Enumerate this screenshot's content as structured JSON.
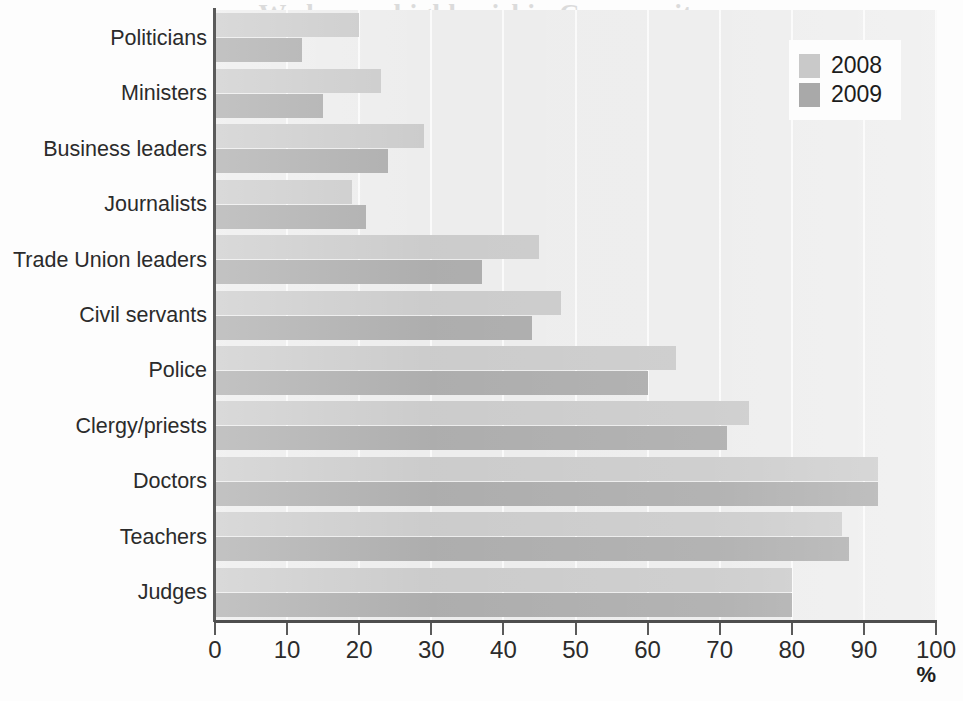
{
  "page": {
    "width": 963,
    "height": 701,
    "background": "#fdfdfd",
    "bleed_text": [
      "n. We have a highly riskin Community",
      "the selected and trusted p",
      "of trust in the, to main wo",
      "doctors and teachers, 2008 Only edi",
      "beyond had to know. For instance they con",
      "the equally collapsed",
      "ir organisation in the ways",
      "collate. They were"
    ]
  },
  "chart_data": {
    "type": "bar",
    "orientation": "horizontal",
    "title": "",
    "subtitle": "",
    "xlabel": "%",
    "ylabel": "",
    "xlim": [
      0,
      100
    ],
    "xticks": [
      0,
      10,
      20,
      30,
      40,
      50,
      60,
      70,
      80,
      90,
      100
    ],
    "xtick_labels": [
      "0",
      "10",
      "20",
      "30",
      "40",
      "50",
      "60",
      "70",
      "80",
      "90",
      "100"
    ],
    "grid": "vertical",
    "legend_position": "top-right",
    "categories": [
      "Politicians",
      "Ministers",
      "Business leaders",
      "Journalists",
      "Trade Union leaders",
      "Civil servants",
      "Police",
      "Clergy/priests",
      "Doctors",
      "Teachers",
      "Judges"
    ],
    "series": [
      {
        "name": "2008",
        "color": "#c9c9c9",
        "values": [
          20,
          23,
          29,
          19,
          45,
          48,
          64,
          74,
          92,
          87,
          80
        ]
      },
      {
        "name": "2009",
        "color": "#a9a9a9",
        "values": [
          12,
          15,
          24,
          21,
          37,
          44,
          60,
          71,
          92,
          88,
          80
        ]
      }
    ]
  },
  "legend": {
    "entries": [
      {
        "label": "2008",
        "color": "#c9c9c9"
      },
      {
        "label": "2009",
        "color": "#a9a9a9"
      }
    ]
  },
  "axis": {
    "x_unit_label": "%",
    "axis_color": "#4e4e4e",
    "gridline_color": "#fafafa",
    "plot_background": "#ececec"
  }
}
